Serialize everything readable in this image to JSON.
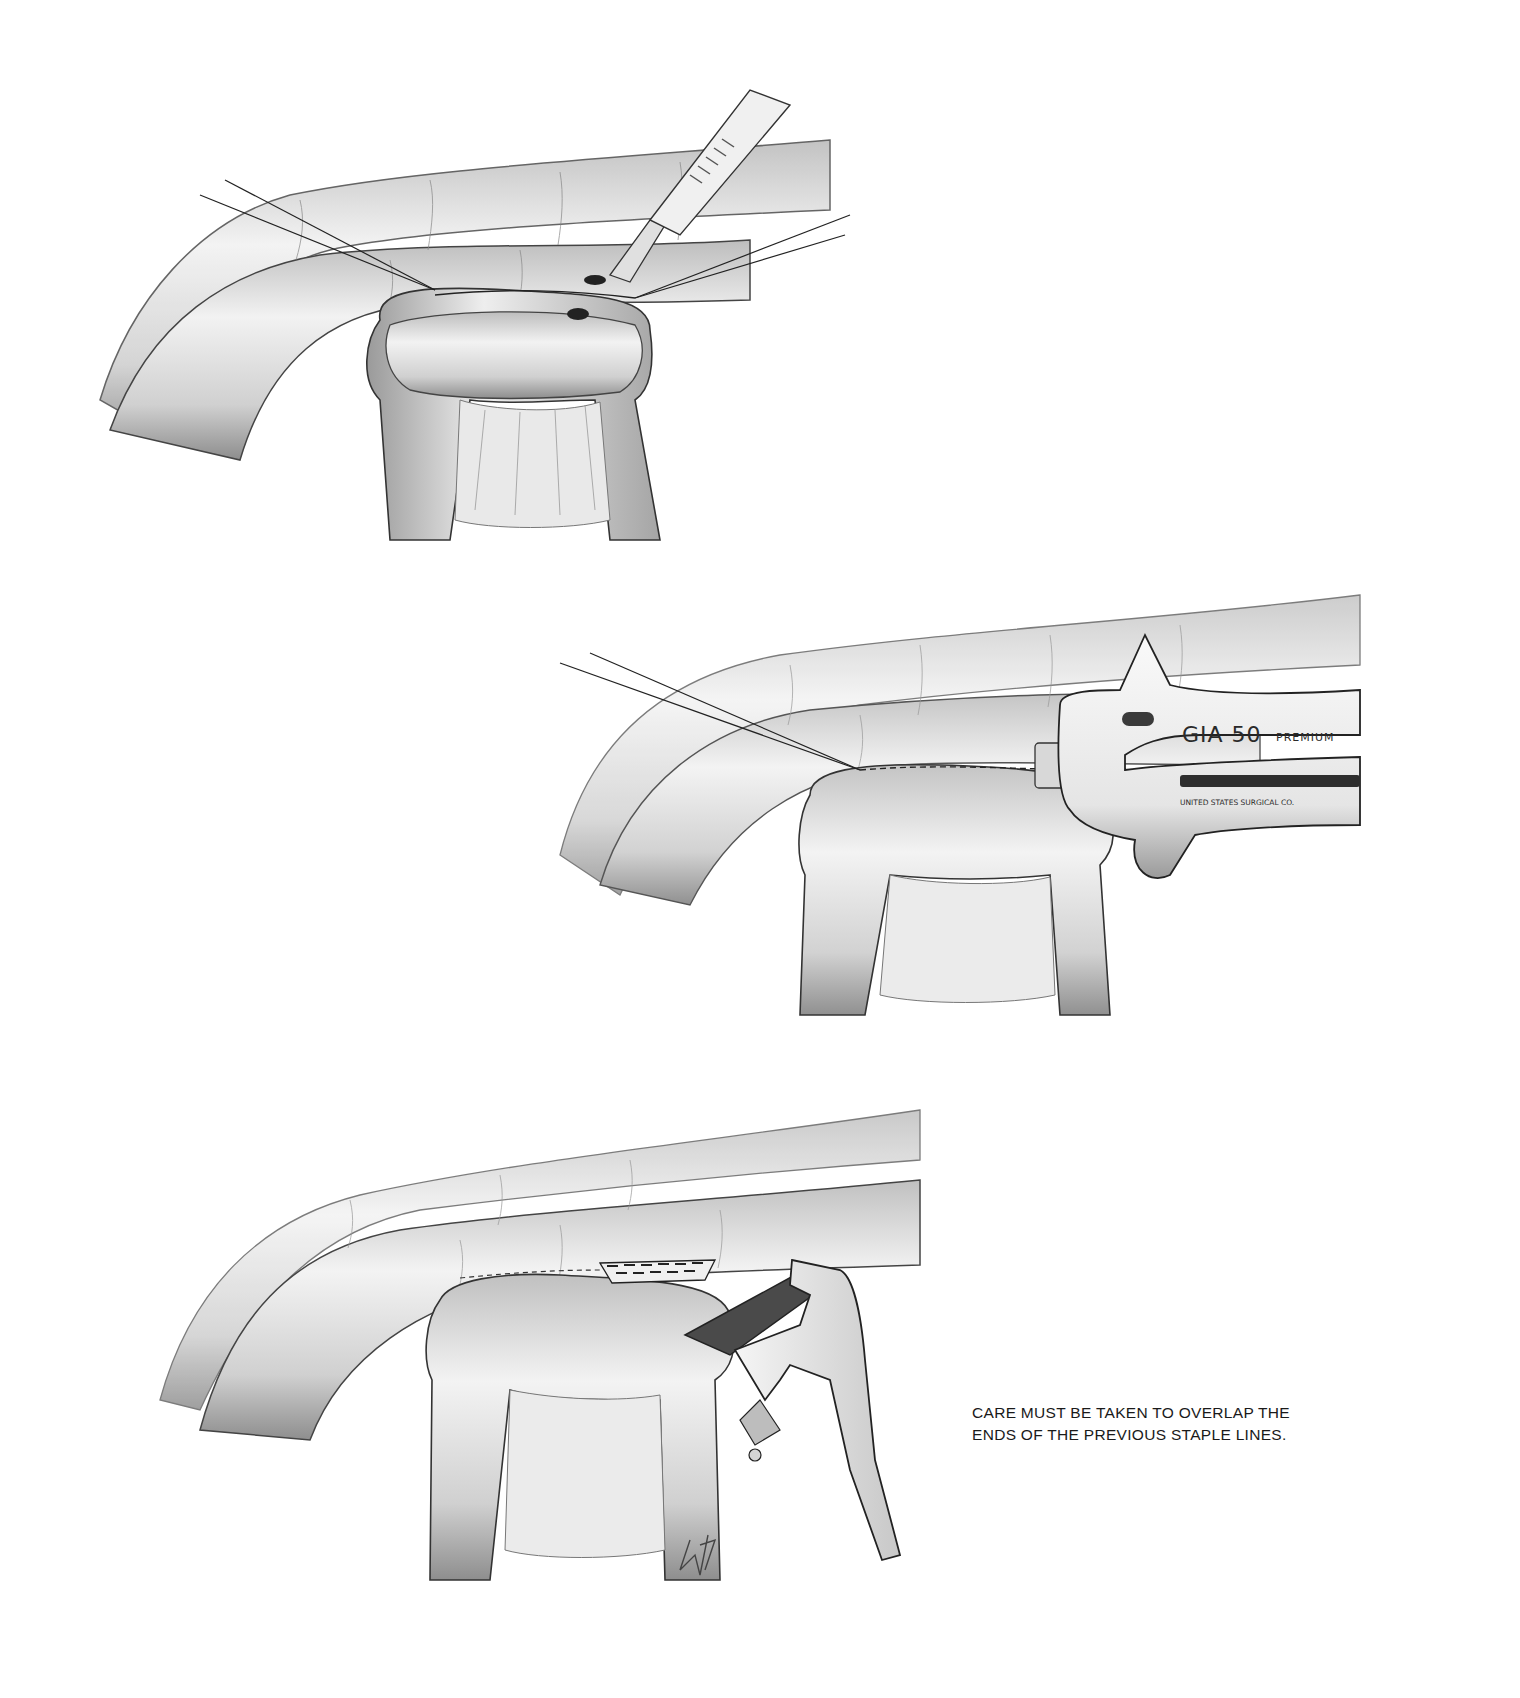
{
  "figure": {
    "panels": [
      {
        "id": "panel-1",
        "description": "Enterotomies made with scalpel between stay sutures on apposed bowel loops",
        "instrument": "scalpel"
      },
      {
        "id": "panel-2",
        "description": "Stapler inserted into enterotomies to create side-to-side anastomosis",
        "instrument": "linear-stapler",
        "instrument_label": "GIA 50",
        "instrument_sublabel": "PREMIUM",
        "manufacturer_label": "UNITED STATES SURGICAL CO."
      },
      {
        "id": "panel-3",
        "description": "Closure of common enterotomy with stapler; staple lines overlapped",
        "instrument": "TA-stapler"
      }
    ],
    "caption": {
      "line1": "CARE MUST BE TAKEN TO OVERLAP THE",
      "line2": "ENDS OF THE PREVIOUS STAPLE LINES."
    },
    "signature": "WS"
  }
}
